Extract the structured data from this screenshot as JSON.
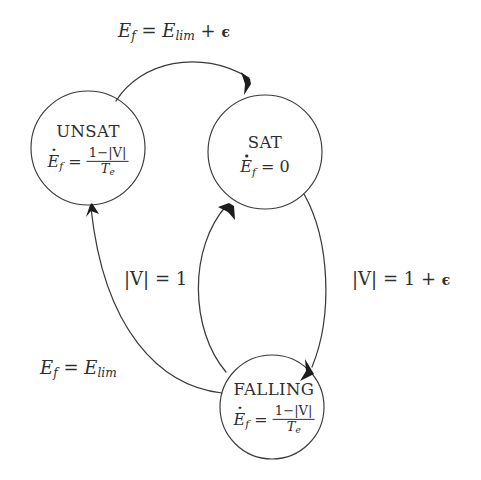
{
  "diagram": {
    "background_color": "#ffffff",
    "stroke_color": "#3a3a3a",
    "text_color": "#2e2e2e",
    "states": [
      {
        "id": "unsat",
        "name": "UNSAT",
        "equation_lhs": "E",
        "equation_sub": "f",
        "equation_op": "=",
        "equation_numerator": "1−|V|",
        "equation_denominator_base": "T",
        "equation_denominator_sub": "e",
        "cx": 88,
        "cy": 148,
        "r": 57
      },
      {
        "id": "sat",
        "name": "SAT",
        "equation_lhs": "E",
        "equation_sub": "f",
        "equation_op": "=",
        "equation_value": "0",
        "cx": 265,
        "cy": 152,
        "r": 57
      },
      {
        "id": "falling",
        "name": "FALLING",
        "equation_lhs": "E",
        "equation_sub": "f",
        "equation_op": "=",
        "equation_numerator": "1−|V|",
        "equation_denominator_base": "T",
        "equation_denominator_sub": "e",
        "cx": 272,
        "cy": 407,
        "r": 52
      }
    ],
    "transitions": [
      {
        "id": "unsat-to-sat",
        "from": "unsat",
        "to": "sat",
        "label_lhs": "E",
        "label_lhs_sub": "f",
        "label_op": "=",
        "label_rhs": "E",
        "label_rhs_sub": "lim",
        "label_plus": "+",
        "label_eps": "ϵ",
        "label_x": 118,
        "label_y": 22
      },
      {
        "id": "sat-to-falling",
        "from": "sat",
        "to": "falling",
        "label_lhs": "|V|",
        "label_op": "=",
        "label_rhs": "1",
        "label_plus": "+",
        "label_eps": "ϵ",
        "label_x": 352,
        "label_y": 270
      },
      {
        "id": "falling-to-sat",
        "from": "falling",
        "to": "sat",
        "label_lhs": "|V|",
        "label_op": "=",
        "label_rhs": "1",
        "label_x": 124,
        "label_y": 270
      },
      {
        "id": "falling-to-unsat",
        "from": "falling",
        "to": "unsat",
        "label_lhs": "E",
        "label_lhs_sub": "f",
        "label_op": "=",
        "label_rhs": "E",
        "label_rhs_sub": "lim",
        "label_x": 40,
        "label_y": 359
      }
    ]
  }
}
